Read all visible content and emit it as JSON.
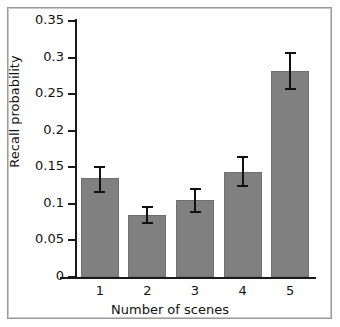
{
  "chart_data": {
    "type": "bar",
    "title": "",
    "xlabel": "Number of scenes",
    "ylabel": "Recall probability",
    "categories": [
      "1",
      "2",
      "3",
      "4",
      "5"
    ],
    "values": [
      0.135,
      0.085,
      0.105,
      0.144,
      0.281
    ],
    "errors_low": [
      0.115,
      0.072,
      0.088,
      0.123,
      0.256
    ],
    "errors_high": [
      0.152,
      0.097,
      0.122,
      0.165,
      0.307
    ],
    "ylim": [
      0,
      0.35
    ],
    "yticks": [
      0,
      0.05,
      0.1,
      0.15,
      0.2,
      0.25,
      0.3,
      0.35
    ],
    "ytick_labels": [
      "0",
      "0.05",
      "0.1",
      "0.15",
      "0.2",
      "0.25",
      "0.3",
      "0.35"
    ],
    "xtick_labels": [
      "1",
      "2",
      "3",
      "4",
      "5"
    ],
    "grid": false,
    "legend": null,
    "bar_color": "#808080",
    "axis_color": "#111111",
    "frame_color": "#9a9a9a",
    "background": "#ffffff"
  }
}
